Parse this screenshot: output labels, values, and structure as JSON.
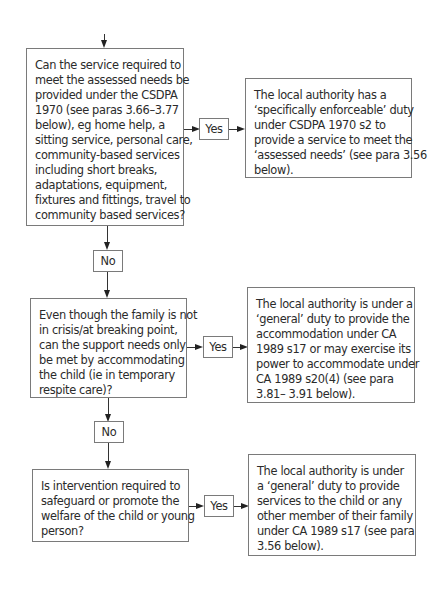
{
  "flowchart": {
    "questions": [
      {
        "id": "q1",
        "lines": [
          "Can the service required to",
          "meet the assessed needs be",
          "provided under the CSDPA",
          "1970 (see paras 3.66–3.77",
          "below), eg home help, a",
          "sitting service, personal care,",
          "community-based services",
          "including short breaks,",
          "adaptations, equipment,",
          "fixtures and fittings, travel to",
          "community based services?"
        ]
      },
      {
        "id": "q2",
        "lines": [
          "Even though the family is not",
          "in crisis/at breaking point,",
          "can the support needs only",
          "be met by accommodating",
          "the child (ie in temporary",
          "respite care)?"
        ]
      },
      {
        "id": "q3",
        "lines": [
          "Is intervention required to",
          "safeguard or promote the",
          "welfare of the child or young",
          "person?"
        ]
      }
    ],
    "outcomes": [
      {
        "id": "o1",
        "lines": [
          "The local authority has a",
          "‘specifically enforceable’ duty",
          "under CSDPA 1970 s2 to",
          "provide a service to meet the",
          "‘assessed needs’ (see para 3.56",
          "below)."
        ]
      },
      {
        "id": "o2",
        "lines": [
          "The local authority is under a",
          "‘general’ duty to provide the",
          "accommodation under CA",
          "1989 s17 or may exercise its",
          "power to accommodate under",
          "CA 1989 s20(4) (see para",
          "3.81– 3.91 below)."
        ]
      },
      {
        "id": "o3",
        "lines": [
          "The local authority is under",
          "a ‘general’ duty to provide",
          "services to the child or any",
          "other member of their family",
          "under CA 1989 s17 (see para",
          "3.56 below)."
        ]
      }
    ],
    "yes_label": "Yes",
    "no_label": "No"
  }
}
